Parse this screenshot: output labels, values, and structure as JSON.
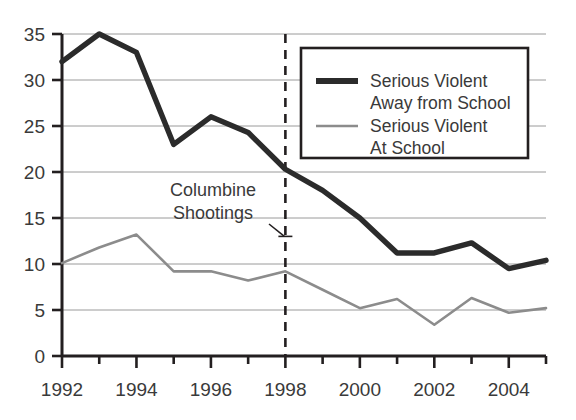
{
  "chart_data": {
    "type": "line",
    "title": "",
    "xlabel": "",
    "ylabel": "",
    "x": [
      1992,
      1993,
      1994,
      1995,
      1996,
      1997,
      1998,
      1999,
      2000,
      2001,
      2002,
      2003,
      2004,
      2005
    ],
    "xlim": [
      1992,
      2005
    ],
    "ylim": [
      0,
      35
    ],
    "grid": true,
    "legend_position": "top-right",
    "series": [
      {
        "name": "Serious Violent Away from School",
        "color": "#2b2b2b",
        "width": "thick",
        "values": [
          32,
          35,
          33,
          23,
          26,
          24.3,
          20.3,
          18,
          15,
          11.2,
          11.2,
          12.3,
          9.5,
          10.4
        ]
      },
      {
        "name": "Serious Violent At School",
        "color": "#8c8c8c",
        "width": "thin",
        "values": [
          10.1,
          11.8,
          13.2,
          9.2,
          9.2,
          8.2,
          9.2,
          7.2,
          5.2,
          6.2,
          3.4,
          6.3,
          4.7,
          5.2
        ]
      }
    ],
    "ytick_labels": [
      "0",
      "5",
      "10",
      "15",
      "20",
      "25",
      "30",
      "35"
    ],
    "ytick_values": [
      0,
      5,
      10,
      15,
      20,
      25,
      30,
      35
    ],
    "xtick_values": [
      1992,
      1993,
      1994,
      1995,
      1996,
      1997,
      1998,
      1999,
      2000,
      2001,
      2002,
      2003,
      2004,
      2005
    ],
    "xtick_labels": [
      "1992",
      "",
      "1994",
      "",
      "1996",
      "",
      "1998",
      "",
      "2000",
      "",
      "2002",
      "",
      "2004",
      ""
    ],
    "annotations": [
      {
        "text_line1": "Columbine",
        "text_line2": "Shootings",
        "marker_x": 1998,
        "marker_y": 13,
        "style": "dashed-vertical-line"
      }
    ]
  },
  "axes": {
    "y_labels": [
      "35",
      "30",
      "25",
      "20",
      "15",
      "10",
      "5",
      "0"
    ],
    "x_labels": [
      "1992",
      "1994",
      "1996",
      "1998",
      "2000",
      "2004"
    ]
  },
  "legend": {
    "entries": [
      {
        "line1": "Serious Violent",
        "line2": "Away from School"
      },
      {
        "line1": "Serious Violent",
        "line2": "At School"
      }
    ]
  },
  "annotation": {
    "line1": "Columbine",
    "line2": "Shootings"
  },
  "colors": {
    "background": "#ffffff",
    "axis": "#231f20",
    "grid": "#9a9a9a",
    "series_away": "#2b2b2b",
    "series_at": "#8c8c8c",
    "text": "#3a3a3a"
  }
}
